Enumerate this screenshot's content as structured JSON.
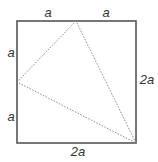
{
  "diagram": {
    "type": "geometry",
    "square": {
      "x": 17,
      "y": 21,
      "width": 119,
      "height": 122,
      "stroke": "#555555"
    },
    "triangle": {
      "vertices": [
        {
          "name": "top-midpoint",
          "x": 76,
          "y": 21
        },
        {
          "name": "left-midpoint",
          "x": 17,
          "y": 82
        },
        {
          "name": "bottom-right-corner",
          "x": 136,
          "y": 143
        }
      ],
      "stroke": "#888888",
      "style": "dotted"
    },
    "labels": {
      "top_left": "a",
      "top_right": "a",
      "left_upper": "a",
      "left_lower": "a",
      "right": "2a",
      "bottom": "2a"
    }
  }
}
